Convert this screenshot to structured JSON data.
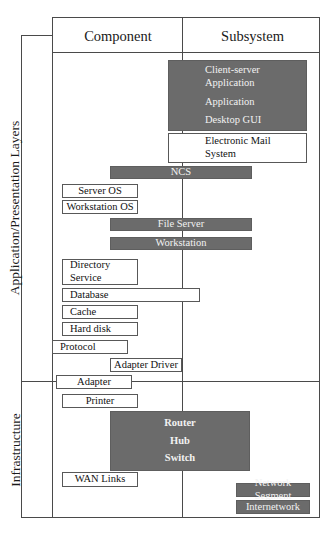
{
  "diagram": {
    "colors": {
      "gray_fill": "#6b6b6b",
      "white_fill": "#ffffff",
      "line": "#4a4a4a",
      "node_border": "#585858",
      "gray_text": "#f2f2f2"
    },
    "columns": [
      {
        "label": "Component"
      },
      {
        "label": "Subsystem"
      }
    ],
    "sections": [
      {
        "label": "Application/Presentation Layers"
      },
      {
        "label": "Infrastructure"
      }
    ],
    "nodes": [
      {
        "id": "client-server-group",
        "fill": "gray",
        "labels": [
          "Client-server Application",
          "Application",
          "Desktop GUI"
        ]
      },
      {
        "id": "client-server-application",
        "fill": "gray",
        "label_line1": "Client-server",
        "label_line2": "Application"
      },
      {
        "id": "application",
        "fill": "gray",
        "label": "Application"
      },
      {
        "id": "desktop-gui",
        "fill": "gray",
        "label": "Desktop GUI"
      },
      {
        "id": "electronic-mail-system",
        "fill": "white",
        "label_line1": "Electronic Mail",
        "label_line2": "System"
      },
      {
        "id": "ncs",
        "fill": "gray",
        "label": "NCS"
      },
      {
        "id": "server-os",
        "fill": "white",
        "label": "Server OS"
      },
      {
        "id": "workstation-os",
        "fill": "white",
        "label": "Workstation OS"
      },
      {
        "id": "file-server",
        "fill": "gray",
        "label": "File Server"
      },
      {
        "id": "workstation",
        "fill": "gray",
        "label": "Workstation"
      },
      {
        "id": "directory-service",
        "fill": "white",
        "label_line1": "Directory",
        "label_line2": "Service"
      },
      {
        "id": "database",
        "fill": "white",
        "label": "Database"
      },
      {
        "id": "cache",
        "fill": "white",
        "label": "Cache"
      },
      {
        "id": "hard-disk",
        "fill": "white",
        "label": "Hard disk"
      },
      {
        "id": "protocol",
        "fill": "white",
        "label": "Protocol"
      },
      {
        "id": "adapter-driver",
        "fill": "white",
        "label": "Adapter Driver"
      },
      {
        "id": "adapter",
        "fill": "white",
        "label": "Adapter"
      },
      {
        "id": "printer",
        "fill": "white",
        "label": "Printer"
      },
      {
        "id": "router-hub-switch",
        "fill": "gray",
        "labels": [
          "Router",
          "Hub",
          "Switch"
        ]
      },
      {
        "id": "router",
        "fill": "gray",
        "label": "Router"
      },
      {
        "id": "hub",
        "fill": "gray",
        "label": "Hub"
      },
      {
        "id": "switch",
        "fill": "gray",
        "label": "Switch"
      },
      {
        "id": "wan-links",
        "fill": "white",
        "label": "WAN Links"
      },
      {
        "id": "network-segment",
        "fill": "gray",
        "label": "Network Segment"
      },
      {
        "id": "internetwork",
        "fill": "gray",
        "label": "Internetwork"
      }
    ]
  }
}
